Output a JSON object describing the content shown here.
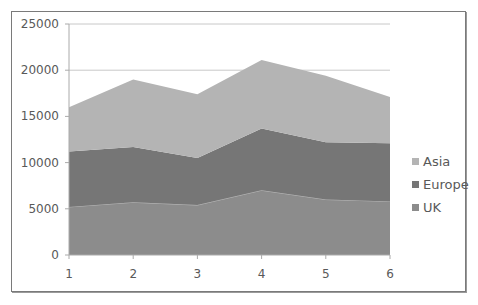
{
  "chart_data": {
    "type": "area",
    "stacked": true,
    "title": "",
    "xlabel": "",
    "ylabel": "",
    "categories": [
      "1",
      "2",
      "3",
      "4",
      "5",
      "6"
    ],
    "ylim": [
      0,
      25000
    ],
    "yticks": [
      "0",
      "5000",
      "10000",
      "15000",
      "20000",
      "25000"
    ],
    "grid": true,
    "legend_position": "right",
    "series": [
      {
        "name": "UK",
        "color": "#8c8c8c",
        "values": [
          5200,
          5700,
          5400,
          7000,
          6000,
          5800
        ]
      },
      {
        "name": "Europe",
        "color": "#767676",
        "values": [
          6000,
          6000,
          5100,
          6700,
          6200,
          6300
        ]
      },
      {
        "name": "Asia",
        "color": "#b4b4b4",
        "values": [
          4800,
          7300,
          6900,
          7400,
          7200,
          5000
        ]
      }
    ]
  },
  "legend": {
    "items": [
      {
        "label": "Asia",
        "color": "#b4b4b4"
      },
      {
        "label": "Europe",
        "color": "#767676"
      },
      {
        "label": "UK",
        "color": "#8c8c8c"
      }
    ]
  }
}
